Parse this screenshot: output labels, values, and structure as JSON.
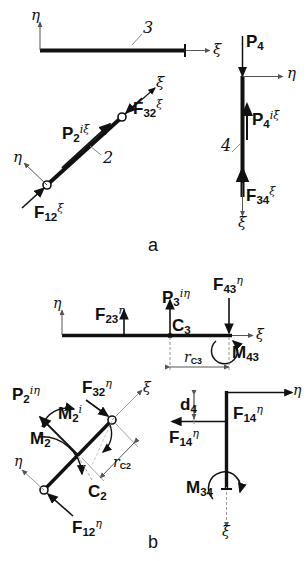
{
  "figure": {
    "caption_a": "a",
    "caption_b": "b",
    "subfigures": [
      {
        "id": "a",
        "description": "Free body diagrams of links 3, 2 and 4 with xi-eta local axes",
        "links": [
          {
            "name": "3",
            "orientation": "horizontal"
          },
          {
            "name": "2",
            "orientation": "diagonal"
          },
          {
            "name": "4",
            "orientation": "vertical"
          }
        ]
      },
      {
        "id": "b",
        "description": "Free body diagrams showing eta-direction forces and moments",
        "links": [
          {
            "name": "3",
            "orientation": "horizontal"
          },
          {
            "name": "2",
            "orientation": "diagonal"
          },
          {
            "name": "4",
            "orientation": "vertical"
          }
        ]
      }
    ]
  },
  "axes": {
    "xi": "ξ",
    "eta": "η"
  },
  "panel_a": {
    "link3": {
      "link_number": "3",
      "axis_eta": "η",
      "axis_xi": "ξ"
    },
    "link2": {
      "link_number": "2",
      "axis_eta": "η",
      "axis_xi_top": "ξ",
      "forces": [
        {
          "base": "P",
          "sub": "2",
          "sup": "iξ"
        },
        {
          "base": "F",
          "sub": "32",
          "sup": "ξ"
        },
        {
          "base": "F",
          "sub": "12",
          "sup": "ξ"
        }
      ]
    },
    "link4": {
      "link_number": "4",
      "axis_eta": "η",
      "axis_xi_top": "ξ",
      "axis_xi_bottom": "ξ",
      "forces": [
        {
          "base": "P",
          "sub": "4",
          "sup": ""
        },
        {
          "base": "P",
          "sub": "4",
          "sup": "iξ"
        },
        {
          "base": "F",
          "sub": "34",
          "sup": "ξ"
        }
      ]
    }
  },
  "panel_b": {
    "link3": {
      "axis_eta": "η",
      "axis_xi": "ξ",
      "center_of_mass": "C₃",
      "cm_base": "C",
      "cm_sub": "3",
      "dimension": {
        "base": "r",
        "sub": "C3"
      },
      "forces": [
        {
          "base": "F",
          "sub": "23",
          "sup": "η"
        },
        {
          "base": "P",
          "sub": "3",
          "sup": "iη"
        },
        {
          "base": "F",
          "sub": "43",
          "sup": "η"
        }
      ],
      "moments": [
        {
          "base": "M",
          "sub": "43"
        }
      ]
    },
    "link2": {
      "axis_eta": "η",
      "axis_xi": "ξ",
      "cm_base": "C",
      "cm_sub": "2",
      "dimension": {
        "base": "r",
        "sub": "C2"
      },
      "forces": [
        {
          "base": "P",
          "sub": "2",
          "sup": "iη"
        },
        {
          "base": "F",
          "sub": "32",
          "sup": "η"
        },
        {
          "base": "F",
          "sub": "12",
          "sup": "η"
        }
      ],
      "moments": [
        {
          "base": "M",
          "sub": "2",
          "sup": "i"
        },
        {
          "base": "M",
          "sub": "2"
        }
      ]
    },
    "link4": {
      "axis_eta": "η",
      "axis_xi": "ξ",
      "dimension": {
        "base": "d",
        "sub": "4"
      },
      "forces": [
        {
          "base": "F",
          "sub": "14",
          "sup": "η",
          "position": "right"
        },
        {
          "base": "F",
          "sub": "14",
          "sup": "η",
          "position": "left"
        }
      ],
      "moments": [
        {
          "base": "M",
          "sub": "34"
        }
      ]
    }
  },
  "colors": {
    "ink": "#111111",
    "thin": "#555555",
    "background": "#ffffff"
  }
}
